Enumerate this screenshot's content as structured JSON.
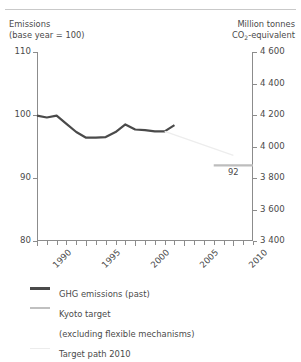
{
  "header": {
    "top_glyph": "",
    "left_caption_line1": "Emissions",
    "left_caption_line2": "(base year = 100)",
    "right_caption_line1": "Million tonnes",
    "right_caption_line2_pre": "CO",
    "right_caption_line2_sub": "2",
    "right_caption_line2_post": "-equivalent"
  },
  "legend": {
    "items": [
      {
        "label": "GHG emissions (past)",
        "color": "#4a4a4a",
        "style": "thick"
      },
      {
        "label": "Kyoto target",
        "color": "#c0c0c0",
        "style": "thin"
      },
      {
        "label": "(excluding flexible mechanisms)",
        "color": "",
        "style": "none"
      },
      {
        "label": "Target path 2010",
        "color": "#ececec",
        "style": "faint"
      }
    ]
  },
  "chart_data": {
    "type": "line",
    "title": "",
    "xlabel": "",
    "ylabel": "Emissions (base year = 100)",
    "y2label": "Million tonnes CO2-equivalent",
    "xlim": [
      1990,
      2012
    ],
    "ylim": [
      80,
      110
    ],
    "y2lim": [
      3400,
      4600
    ],
    "grid": false,
    "legend_position": "below",
    "yticks": [
      80,
      90,
      100,
      110
    ],
    "ytick_labels": [
      "80",
      "90",
      "100",
      "110"
    ],
    "y2ticks": [
      3400,
      3600,
      3800,
      4000,
      4200,
      4400,
      4600
    ],
    "y2tick_labels": [
      "3 400",
      "3 600",
      "3 800",
      "4 000",
      "4 200",
      "4 400",
      "4 600"
    ],
    "xticks": [
      1990,
      1991,
      1992,
      1993,
      1994,
      1995,
      1996,
      1997,
      1998,
      1999,
      2000,
      2001,
      2002,
      2003,
      2004,
      2005,
      2006,
      2007,
      2008,
      2009,
      2010,
      2011,
      2012
    ],
    "xtick_major": [
      1990,
      1995,
      2000,
      2005,
      2010
    ],
    "xtick_labels": [
      "1990",
      "1995",
      "2000",
      "2005",
      "2010"
    ],
    "series": [
      {
        "name": "GHG emissions (past)",
        "color": "#4a4a4a",
        "width": 2.2,
        "x": [
          1990,
          1991,
          1992,
          1993,
          1994,
          1995,
          1996,
          1997,
          1998,
          1999,
          2000,
          2001,
          2002,
          2003,
          2004
        ],
        "values": [
          99.9,
          99.6,
          99.9,
          98.6,
          97.3,
          96.4,
          96.4,
          96.5,
          97.3,
          98.5,
          97.7,
          97.6,
          97.4,
          97.4,
          98.4
        ]
      },
      {
        "name": "Kyoto target",
        "color": "#bdbdbd",
        "width": 2.2,
        "x": [
          2008,
          2012
        ],
        "values": [
          92,
          92
        ],
        "annotation": "92"
      },
      {
        "name": "Target path 2010",
        "color": "#ededed",
        "width": 1.2,
        "x": [
          2003,
          2010
        ],
        "values": [
          97.4,
          93.6
        ]
      }
    ]
  }
}
